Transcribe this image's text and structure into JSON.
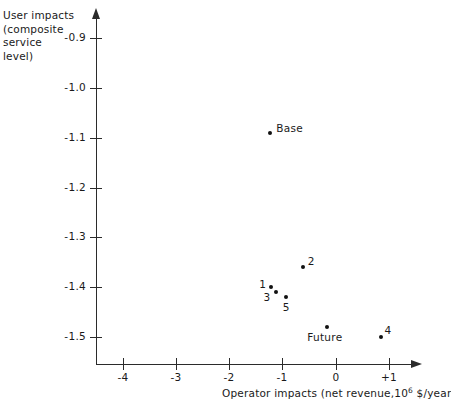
{
  "chart_data": {
    "type": "scatter",
    "title": "",
    "xlabel": "Operator impacts (net revenue, 10⁶ $/year",
    "xlabel_parts": {
      "before": "Operator impacts (net revenue,10",
      "exponent": "6",
      "after": " $/year"
    },
    "ylabel": "User impacts (composite service level)",
    "ylabel_lines": [
      "User impacts",
      "(composite service",
      "level)"
    ],
    "xlim": [
      -4.5,
      1.45
    ],
    "ylim": [
      -1.555,
      -0.855
    ],
    "xticks": [
      -4,
      -3,
      -2,
      -1,
      0,
      1
    ],
    "xtick_labels": [
      "-4",
      "-3",
      "-2",
      "-1",
      "0",
      "+1"
    ],
    "yticks": [
      -0.9,
      -1.0,
      -1.1,
      -1.2,
      -1.3,
      -1.4,
      -1.5
    ],
    "ytick_labels": [
      "-0.9",
      "-1.0",
      "-1.1",
      "-1.2",
      "-1.3",
      "-1.4",
      "-1.5"
    ],
    "grid": false,
    "legend": "none",
    "marker_color": "#111111",
    "axis_color": "#2b2b2b",
    "points": [
      {
        "label": "Base",
        "x": -1.23,
        "y": -1.09,
        "label_dx": 6,
        "label_dy": -11
      },
      {
        "label": "2",
        "x": -0.62,
        "y": -1.36,
        "label_dx": 5,
        "label_dy": -12
      },
      {
        "label": "1",
        "x": -1.21,
        "y": -1.4,
        "label_dx": -12,
        "label_dy": -9
      },
      {
        "label": "3",
        "x": -1.13,
        "y": -1.41,
        "label_dx": -12,
        "label_dy": -1
      },
      {
        "label": "5",
        "x": -0.94,
        "y": -1.42,
        "label_dx": -3,
        "label_dy": 4
      },
      {
        "label": "Future",
        "x": -0.16,
        "y": -1.48,
        "label_dx": -20,
        "label_dy": 4
      },
      {
        "label": "4",
        "x": 0.84,
        "y": -1.5,
        "label_dx": 4,
        "label_dy": -13
      }
    ]
  }
}
